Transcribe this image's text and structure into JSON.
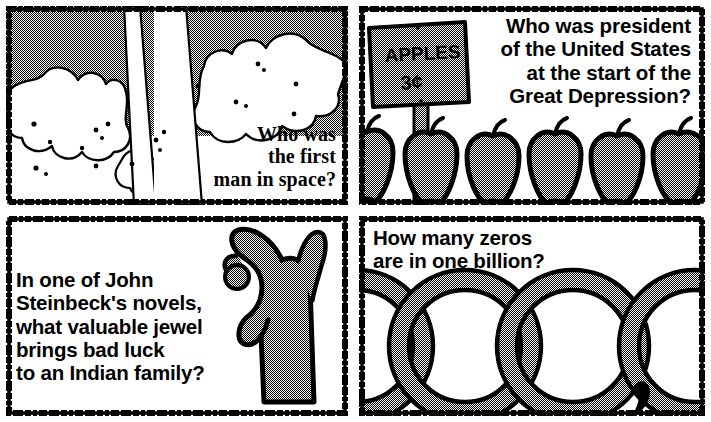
{
  "sheet": {
    "width": 711,
    "height": 422,
    "layout": "2x2-comic-panel-grid",
    "background_color": "#ffffff",
    "ink_color": "#000000",
    "halftone_gray": "#9a9a9a"
  },
  "panels": [
    {
      "id": "panel-space",
      "position": "top-left",
      "caption": "Who was\nthe first\nman in space?",
      "caption_align": "right",
      "caption_style": "serif",
      "illustration": "rocket-launch-exhaust-clouds",
      "illustration_notes": "rocket exhaust plume rising through billowing dithered clouds against halftone sky"
    },
    {
      "id": "panel-president",
      "position": "top-right",
      "caption": "Who was president\nof the United States\nat the start of the\nGreat Depression?",
      "caption_align": "right",
      "caption_style": "sans",
      "illustration": "apple-stand-with-sign",
      "sign_text_line1": "APPLES",
      "sign_text_line2": "3¢",
      "apple_count": 6
    },
    {
      "id": "panel-steinbeck",
      "position": "bottom-left",
      "caption": "In one of John\nSteinbeck's novels,\nwhat valuable jewel\nbrings bad luck\nto an Indian family?",
      "caption_align": "left",
      "caption_style": "sans",
      "illustration": "hand-holding-pearl",
      "illustration_notes": "stylized hand pinching a round pearl between thumb and fingers"
    },
    {
      "id": "panel-billion",
      "position": "bottom-right",
      "caption": "How many zeros\nare in one billion?",
      "caption_align": "left",
      "caption_style": "sans",
      "illustration": "row-of-zeros-with-comma",
      "zero_count": 4,
      "has_comma": true
    }
  ]
}
